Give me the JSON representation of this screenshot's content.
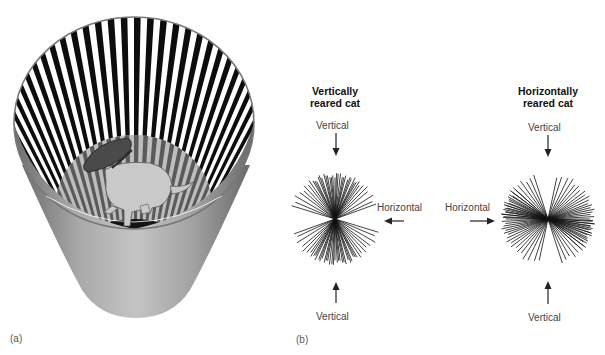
{
  "figure": {
    "panel_a": {
      "label": "(a)",
      "illustration": "cat-in-striped-cylinder",
      "colors": {
        "stripe_dark": "#0d0d0d",
        "stripe_light": "#ffffff",
        "cone_mid": "#a6a6a6",
        "cone_dark": "#6e6e6e",
        "floor": "#141414"
      }
    },
    "panel_b": {
      "label": "(b)",
      "vertical_cat": {
        "title_line1": "Vertically",
        "title_line2": "reared cat",
        "top_label": "Vertical",
        "side_label": "Horizontal",
        "bottom_label": "Vertical",
        "center": [
          335,
          219
        ],
        "radius": 47,
        "angles_deg": [
          90,
          86,
          93,
          97,
          83,
          100,
          80,
          104,
          76,
          108,
          72,
          112,
          68,
          116,
          64,
          120,
          60,
          124,
          57,
          128,
          54,
          133,
          50,
          138,
          45,
          143,
          40,
          150,
          32,
          157,
          25,
          163,
          20,
          95,
          88,
          102,
          78,
          110,
          70,
          118,
          62
        ]
      },
      "horizontal_cat": {
        "title_line1": "Horizontally",
        "title_line2": "reared cat",
        "top_label": "Vertical",
        "side_label": "Horizontal",
        "bottom_label": "Vertical",
        "center": [
          548,
          219
        ],
        "radius": 48,
        "angles_deg": [
          0,
          3,
          -3,
          6,
          -6,
          9,
          -9,
          12,
          -12,
          15,
          -15,
          18,
          -18,
          21,
          -21,
          25,
          -25,
          29,
          -29,
          33,
          -33,
          37,
          -37,
          42,
          -42,
          47,
          52,
          58,
          64,
          72,
          78,
          108,
          114,
          120,
          126,
          132,
          138,
          143,
          148,
          153,
          158,
          162,
          166,
          170,
          174,
          178
        ]
      }
    }
  }
}
